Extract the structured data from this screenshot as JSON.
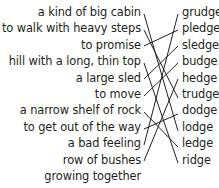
{
  "definitions": [
    "a kind of big cabin",
    "to walk with heavy steps",
    "to promise",
    "hill with a long, thin top",
    "a large sled",
    "to move",
    "a narrow shelf of rock",
    "to get out of the way",
    "a bad feeling",
    "row of bushes",
    "growing together"
  ],
  "words": [
    "grudge",
    "pledge",
    "sledge",
    "budge",
    "hedge",
    "trudge",
    "dodge",
    "lodge",
    "ledge",
    "ridge"
  ],
  "matches": [
    {
      "definition": "a kind of big cabin",
      "word": "lodge"
    },
    {
      "definition": "to walk with heavy steps",
      "word": "trudge"
    },
    {
      "definition": "to promise",
      "word": "pledge"
    },
    {
      "definition": "hill with a long, thin top",
      "word": "ridge"
    },
    {
      "definition": "a large sled",
      "word": "sledge"
    },
    {
      "definition": "to move",
      "word": "budge"
    },
    {
      "definition": "a narrow shelf of rock",
      "word": "ledge"
    },
    {
      "definition": "to get out of the way",
      "word": "dodge"
    },
    {
      "definition": "a bad feeling",
      "word": "grudge"
    },
    {
      "definition": "row of bushes growing together",
      "word": "hedge"
    }
  ]
}
